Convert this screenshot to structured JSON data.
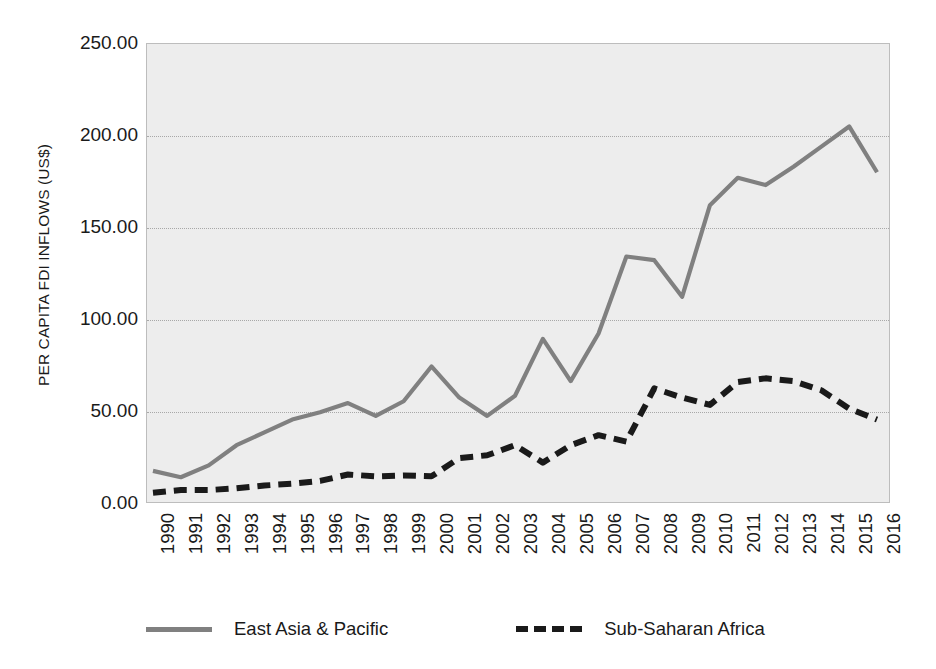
{
  "chart_data": {
    "type": "line",
    "title": "",
    "subtitle": "",
    "xlabel": "",
    "ylabel": "PER CAPITA FDI INFLOWS (US$)",
    "x": [
      1990,
      1991,
      1992,
      1993,
      1994,
      1995,
      1996,
      1997,
      1998,
      1999,
      2000,
      2001,
      2002,
      2003,
      2004,
      2005,
      2006,
      2007,
      2008,
      2009,
      2010,
      2011,
      2012,
      2013,
      2014,
      2015,
      2016
    ],
    "xtick_labels": [
      "1990",
      "1991",
      "1992",
      "1993",
      "1994",
      "1995",
      "1996",
      "1997",
      "1998",
      "1999",
      "2000",
      "2001",
      "2002",
      "2003",
      "2004",
      "2005",
      "2006",
      "2007",
      "2008",
      "2009",
      "2010",
      "2011",
      "2012",
      "2013",
      "2014",
      "2015",
      "2016"
    ],
    "ytick_labels": [
      "250.00",
      "200.00",
      "150.00",
      "100.00",
      "50.00",
      "0.00"
    ],
    "ytick_values": [
      250,
      200,
      150,
      100,
      50,
      0
    ],
    "ylim": [
      0,
      250
    ],
    "grid": true,
    "legend_position": "bottom",
    "plot_background": "#ededed",
    "series": [
      {
        "name": "East Asia & Pacific",
        "color": "#808080",
        "style": "solid",
        "values": [
          17.0,
          13.5,
          20.0,
          31.0,
          38.0,
          45.0,
          49.0,
          54.0,
          47.0,
          55.0,
          74.0,
          57.0,
          47.0,
          58.0,
          89.0,
          66.0,
          92.0,
          134.0,
          132.0,
          112.0,
          162.0,
          177.0,
          173.0,
          183.0,
          194.0,
          205.0,
          180.0
        ]
      },
      {
        "name": "Sub-Saharan Africa",
        "color": "#1a1a1a",
        "style": "dashed",
        "values": [
          5.0,
          6.5,
          6.5,
          7.5,
          9.0,
          10.0,
          11.5,
          15.0,
          14.0,
          14.5,
          14.0,
          24.0,
          25.5,
          31.0,
          21.5,
          31.0,
          36.5,
          33.0,
          62.0,
          57.0,
          53.0,
          65.5,
          67.5,
          66.0,
          61.0,
          51.0,
          45.0
        ]
      }
    ]
  },
  "legend": {
    "entries": [
      {
        "label": "East Asia & Pacific"
      },
      {
        "label": "Sub-Saharan Africa"
      }
    ]
  }
}
